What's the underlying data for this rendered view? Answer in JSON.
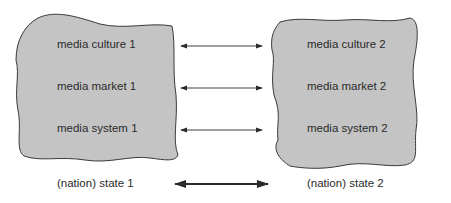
{
  "left_blob": {
    "items": [
      "media culture 1",
      "media market 1",
      "media system 1"
    ],
    "state_label": "(nation) state 1"
  },
  "right_blob": {
    "items": [
      "media culture 2",
      "media market 2",
      "media system 2"
    ],
    "state_label": "(nation) state 2"
  },
  "colors": {
    "blob_fill": "#c4c4c4",
    "blob_stroke": "#3a3a3a",
    "arrow": "#2a2a2a"
  }
}
